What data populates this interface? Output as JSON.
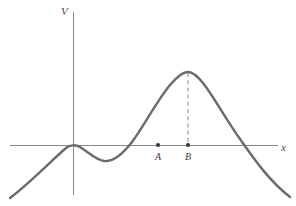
{
  "figure": {
    "background_color": "#ffffff",
    "width": 296,
    "height": 206
  },
  "axes": {
    "y_axis_label": "V",
    "x_axis_label": "x",
    "axis_color": "#8a8a8a",
    "origin_px": {
      "x": 73,
      "y": 145
    },
    "y_axis_top_px": 12,
    "y_axis_bottom_px": 195,
    "x_axis_left_px": 10,
    "x_axis_right_px": 278
  },
  "curve": {
    "name": "potential-energy-curve",
    "color": "#6b6b6b",
    "stroke_width": 2.4,
    "path": "M 10 198 C 30 183, 52 160, 66 148 C 70 144.6, 76 144.6, 80 147 C 88 152, 96 160, 104 161 C 112 162, 122 155, 132 142 C 144 126, 156 102, 170 85 C 178 75.5, 184 72, 188 72 C 192 72, 198 76, 206 87 C 216 101, 228 122, 240 139 C 252 156, 268 180, 290 197"
  },
  "guide_line": {
    "name": "peak-to-B-dashed-line",
    "color": "#9a9a9a",
    "from_px": {
      "x": 188,
      "y": 73
    },
    "to_px": {
      "x": 188,
      "y": 145
    },
    "dash_pattern": "4 3.2"
  },
  "marked_points": [
    {
      "label": "A",
      "x_px": 158,
      "y_px": 145,
      "radius_px": 2.1,
      "color": "#3a3a3a"
    },
    {
      "label": "B",
      "x_px": 188,
      "y_px": 145,
      "radius_px": 2.1,
      "color": "#3a3a3a"
    }
  ],
  "chart_data": {
    "type": "line",
    "title": "",
    "xlabel": "x",
    "ylabel": "V",
    "grid": false,
    "legend": null,
    "axis_style": "cartesian-axes-through-origin",
    "series": [
      {
        "name": "V(x)",
        "color": "#6b6b6b",
        "comment": "Potential energy curve: rises from lower left, touches the x-axis tangentially at the origin (local maximum at V=0), dips to a local minimum below the axis, rises to a global maximum well above the axis, then falls, crossing the x-axis and continuing down to the lower right.",
        "x": [
          -8.4,
          -7.0,
          -5.6,
          -4.2,
          -2.8,
          -1.4,
          0.0,
          1.4,
          2.8,
          4.2,
          5.6,
          7.0,
          8.4,
          9.8,
          11.2,
          12.6,
          14.0,
          15.4,
          16.8,
          18.2,
          19.6,
          21.0,
          22.4,
          23.8,
          25.2,
          26.6,
          28.0,
          29.4,
          30.8
        ],
        "y": [
          -2.4,
          -1.85,
          -1.3,
          -0.78,
          -0.34,
          -0.07,
          0.0,
          -0.12,
          -0.31,
          -0.45,
          -0.48,
          -0.4,
          -0.19,
          0.15,
          0.62,
          1.18,
          1.78,
          2.33,
          2.76,
          2.98,
          3.02,
          2.9,
          2.58,
          2.05,
          1.38,
          0.62,
          -0.22,
          -1.12,
          -2.1
        ]
      }
    ],
    "annotations": [
      {
        "label": "A",
        "x": 17.8,
        "y": 0.0,
        "marker": "dot",
        "note": "point on x-axis left of the peak"
      },
      {
        "label": "B",
        "x": 21.3,
        "y": 0.0,
        "marker": "dot",
        "note": "point on x-axis directly below the global maximum"
      },
      {
        "label": "",
        "type": "dashed-vertical",
        "x": 21.3,
        "y_from": 0.0,
        "y_to": 3.02,
        "note": "dashed line from point B up to the curve peak"
      }
    ],
    "xlim": [
      -8.8,
      31.5
    ],
    "ylim": [
      -2.6,
      3.9
    ],
    "x_tick_labels": [],
    "y_tick_labels": []
  }
}
